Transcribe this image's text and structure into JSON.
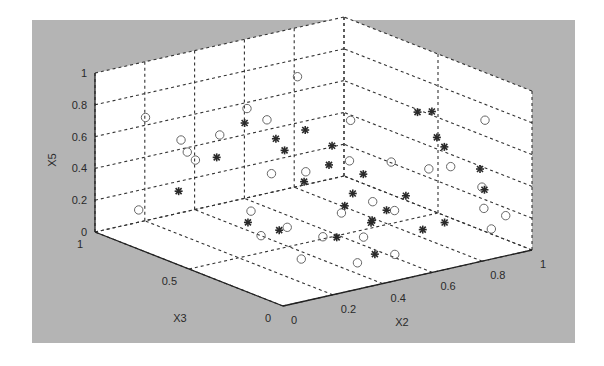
{
  "chart_data": {
    "type": "scatter3d",
    "title": "",
    "xlabel": "X2",
    "ylabel": "X3",
    "zlabel": "X5",
    "xlim": [
      0,
      1
    ],
    "ylim": [
      0,
      1
    ],
    "zlim": [
      0,
      1
    ],
    "grid": true,
    "legend": null,
    "x_ticks": [
      "0",
      "0.2",
      "0.4",
      "0.6",
      "0.8",
      "1"
    ],
    "y_ticks": [
      "0",
      "0.5",
      "1"
    ],
    "z_ticks": [
      "0",
      "0.2",
      "0.4",
      "0.6",
      "0.8",
      "1"
    ],
    "background_color": "#b4b4b4",
    "series": [
      {
        "name": "circles",
        "marker": "o",
        "points": [
          [
            0.15,
            0.93,
            0.7
          ],
          [
            0.1,
            0.9,
            0.15
          ],
          [
            0.27,
            0.9,
            0.53
          ],
          [
            0.28,
            0.88,
            0.46
          ],
          [
            0.29,
            0.85,
            0.42
          ],
          [
            0.35,
            0.8,
            0.58
          ],
          [
            0.4,
            0.7,
            0.13
          ],
          [
            0.38,
            0.62,
            0.02
          ],
          [
            0.55,
            0.92,
            0.62
          ],
          [
            0.52,
            0.75,
            0.3
          ],
          [
            0.6,
            0.88,
            0.55
          ],
          [
            0.62,
            0.7,
            0.3
          ],
          [
            0.7,
            0.85,
            0.8
          ],
          [
            0.72,
            0.6,
            0.38
          ],
          [
            0.65,
            0.55,
            0.1
          ],
          [
            0.5,
            0.45,
            0.05
          ],
          [
            0.55,
            0.3,
            0.1
          ],
          [
            0.47,
            0.6,
            0.05
          ],
          [
            0.8,
            0.7,
            0.56
          ],
          [
            0.75,
            0.4,
            0.15
          ],
          [
            0.85,
            0.55,
            0.35
          ],
          [
            0.9,
            0.3,
            0.42
          ],
          [
            0.95,
            0.2,
            0.32
          ],
          [
            0.92,
            0.15,
            0.22
          ],
          [
            0.97,
            0.1,
            0.18
          ],
          [
            1.0,
            0.25,
            0.7
          ],
          [
            0.95,
            0.15,
            0.08
          ],
          [
            0.6,
            0.2,
            0.02
          ],
          [
            0.3,
            0.3,
            0.05
          ],
          [
            0.45,
            0.2,
            0.02
          ],
          [
            0.7,
            0.45,
            0.2
          ],
          [
            0.85,
            0.35,
            0.4
          ]
        ]
      },
      {
        "name": "stars",
        "marker": "*",
        "points": [
          [
            0.2,
            0.82,
            0.27
          ],
          [
            0.3,
            0.75,
            0.48
          ],
          [
            0.35,
            0.65,
            0.1
          ],
          [
            0.45,
            0.8,
            0.62
          ],
          [
            0.5,
            0.7,
            0.55
          ],
          [
            0.55,
            0.72,
            0.45
          ],
          [
            0.58,
            0.65,
            0.6
          ],
          [
            0.5,
            0.55,
            0.35
          ],
          [
            0.6,
            0.55,
            0.42
          ],
          [
            0.65,
            0.6,
            0.5
          ],
          [
            0.55,
            0.4,
            0.25
          ],
          [
            0.62,
            0.45,
            0.28
          ],
          [
            0.7,
            0.5,
            0.35
          ],
          [
            0.48,
            0.35,
            0.1
          ],
          [
            0.58,
            0.3,
            0.18
          ],
          [
            0.68,
            0.35,
            0.2
          ],
          [
            0.72,
            0.3,
            0.3
          ],
          [
            0.52,
            0.2,
            0.05
          ],
          [
            0.75,
            0.25,
            0.1
          ],
          [
            0.8,
            0.2,
            0.15
          ],
          [
            0.88,
            0.45,
            0.7
          ],
          [
            0.9,
            0.4,
            0.72
          ],
          [
            0.92,
            0.4,
            0.55
          ],
          [
            0.95,
            0.4,
            0.48
          ],
          [
            0.98,
            0.25,
            0.4
          ],
          [
            0.96,
            0.2,
            0.3
          ],
          [
            0.4,
            0.55,
            0.08
          ],
          [
            0.66,
            0.4,
            0.12
          ]
        ]
      }
    ]
  }
}
